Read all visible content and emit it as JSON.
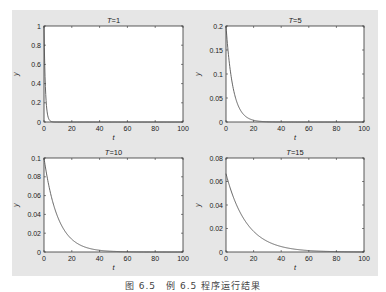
{
  "figure": {
    "background": "#e6e6e6",
    "line_color": "#555555",
    "caption": "图 6.5　例 6.5 程序运行结果"
  },
  "chart_data": [
    {
      "type": "line",
      "title": "T=1",
      "xlabel": "t",
      "ylabel": "y",
      "xlim": [
        0,
        100
      ],
      "ylim": [
        0,
        1
      ],
      "xticks": [
        0,
        20,
        40,
        60,
        80,
        100
      ],
      "yticks": [
        0,
        0.2,
        0.4,
        0.6,
        0.8,
        1
      ],
      "ytick_labels": [
        "0",
        "0.2",
        "0.4",
        "0.6",
        "0.8",
        "1"
      ],
      "grid": false,
      "T": 1,
      "formula": "y = (1/T)·exp(-t/T)",
      "series": [
        {
          "name": "y",
          "x": [
            0,
            1,
            2,
            3,
            4,
            5,
            10
          ],
          "values": [
            1.0,
            0.368,
            0.135,
            0.05,
            0.018,
            0.007,
            0.0
          ]
        }
      ]
    },
    {
      "type": "line",
      "title": "T=5",
      "xlabel": "t",
      "ylabel": "y",
      "xlim": [
        0,
        100
      ],
      "ylim": [
        0,
        0.2
      ],
      "xticks": [
        0,
        20,
        40,
        60,
        80,
        100
      ],
      "yticks": [
        0,
        0.05,
        0.1,
        0.15,
        0.2
      ],
      "ytick_labels": [
        "0",
        "0.05",
        "0.1",
        "0.15",
        "0.2"
      ],
      "grid": false,
      "T": 5,
      "formula": "y = (1/T)·exp(-t/T)",
      "series": [
        {
          "name": "y",
          "x": [
            0,
            5,
            10,
            15,
            20,
            30,
            40
          ],
          "values": [
            0.2,
            0.074,
            0.027,
            0.01,
            0.004,
            0.0005,
            0.0
          ]
        }
      ]
    },
    {
      "type": "line",
      "title": "T=10",
      "xlabel": "t",
      "ylabel": "y",
      "xlim": [
        0,
        100
      ],
      "ylim": [
        0,
        0.1
      ],
      "xticks": [
        0,
        20,
        40,
        60,
        80,
        100
      ],
      "yticks": [
        0,
        0.02,
        0.04,
        0.06,
        0.08,
        0.1
      ],
      "ytick_labels": [
        "0",
        "0.02",
        "0.04",
        "0.06",
        "0.08",
        "0.1"
      ],
      "grid": false,
      "T": 10,
      "formula": "y = (1/T)·exp(-t/T)",
      "series": [
        {
          "name": "y",
          "x": [
            0,
            10,
            20,
            30,
            40,
            50,
            60
          ],
          "values": [
            0.1,
            0.037,
            0.014,
            0.005,
            0.002,
            0.0007,
            0.0
          ]
        }
      ]
    },
    {
      "type": "line",
      "title": "T=15",
      "xlabel": "t",
      "ylabel": "y",
      "xlim": [
        0,
        100
      ],
      "ylim": [
        0,
        0.08
      ],
      "xticks": [
        0,
        20,
        40,
        60,
        80,
        100
      ],
      "yticks": [
        0,
        0.02,
        0.04,
        0.06,
        0.08
      ],
      "ytick_labels": [
        "0",
        "0.02",
        "0.04",
        "0.06",
        "0.08"
      ],
      "grid": false,
      "T": 15,
      "formula": "y = (1/T)·exp(-t/T)",
      "series": [
        {
          "name": "y",
          "x": [
            0,
            15,
            30,
            45,
            60,
            75,
            90
          ],
          "values": [
            0.0667,
            0.0245,
            0.009,
            0.0033,
            0.0012,
            0.0004,
            0.0
          ]
        }
      ]
    }
  ]
}
